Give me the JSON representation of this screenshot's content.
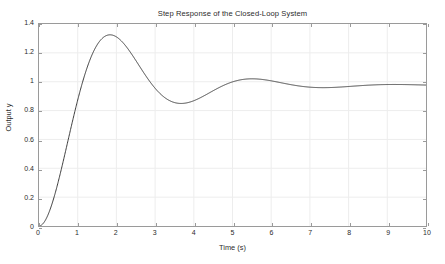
{
  "chart_data": {
    "type": "line",
    "title": "Step Response of the Closed-Loop System",
    "xlabel": "Time (s)",
    "ylabel": "Output y",
    "xlim": [
      0,
      10
    ],
    "ylim": [
      0,
      1.4
    ],
    "grid": true,
    "legend": null,
    "x_ticks": [
      "0",
      "1",
      "2",
      "3",
      "4",
      "5",
      "6",
      "7",
      "8",
      "9",
      "10"
    ],
    "x_tick_values": [
      0,
      1,
      2,
      3,
      4,
      5,
      6,
      7,
      8,
      9,
      10
    ],
    "y_ticks": [
      "0",
      "0.2",
      "0.4",
      "0.6",
      "0.8",
      "1",
      "1.2",
      "1.4"
    ],
    "y_tick_values": [
      0,
      0.2,
      0.4,
      0.6,
      0.8,
      1,
      1.2,
      1.4
    ],
    "series": [
      {
        "name": "Step response y(t)",
        "color": "#3a3a3a",
        "linewidth": 1.0,
        "model": {
          "form": "second-order underdamped step response",
          "dc_gain": 0.975,
          "natural_frequency_wn": 1.8,
          "damping_ratio_zeta": 0.31
        },
        "features": {
          "initial_value": 0.0,
          "peak_value": 1.335,
          "peak_time": 1.9,
          "overshoot_percent": 37,
          "steady_state_value": 0.975,
          "settling_time_approx": 4.6,
          "rise_time_approx": 0.9
        },
        "x": [
          0.0,
          0.1,
          0.2,
          0.3,
          0.4,
          0.5,
          0.6,
          0.7,
          0.8,
          0.9,
          1.0,
          1.1,
          1.2,
          1.3,
          1.4,
          1.5,
          1.6,
          1.7,
          1.8,
          1.9,
          2.0,
          2.2,
          2.4,
          2.6,
          2.8,
          3.0,
          3.2,
          3.4,
          3.6,
          3.8,
          4.0,
          4.2,
          4.4,
          4.6,
          4.8,
          5.0,
          5.5,
          6.0,
          6.5,
          7.0,
          7.5,
          8.0,
          8.5,
          9.0,
          9.5,
          10.0
        ],
        "y": [
          0.0,
          0.015,
          0.057,
          0.122,
          0.205,
          0.301,
          0.406,
          0.514,
          0.622,
          0.727,
          0.825,
          0.914,
          0.993,
          1.06,
          1.116,
          1.161,
          1.196,
          1.221,
          1.238,
          1.247,
          1.25,
          1.239,
          1.214,
          1.181,
          1.144,
          1.107,
          1.072,
          1.042,
          1.018,
          1.0,
          0.987,
          0.978,
          0.973,
          0.971,
          0.97,
          0.971,
          0.974,
          0.976,
          0.976,
          0.976,
          0.975,
          0.975,
          0.975,
          0.975,
          0.975,
          0.975
        ]
      }
    ]
  },
  "axes_style": {
    "background": "#ffffff",
    "axis_color": "#9a9a9a",
    "grid_color": "#ededed",
    "text_color": "#2b2b2b"
  }
}
